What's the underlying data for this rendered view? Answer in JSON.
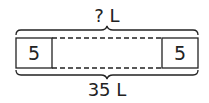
{
  "diagram": {
    "type": "tape-diagram",
    "top_label": "? L",
    "bottom_label": "35 L",
    "left_segment": "5",
    "right_segment": "5",
    "middle_segment": ""
  }
}
